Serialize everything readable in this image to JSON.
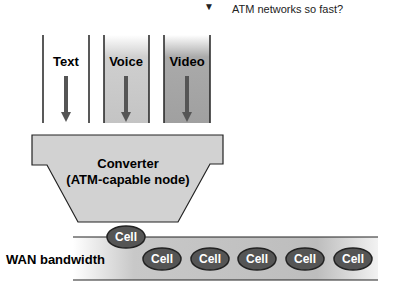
{
  "note": {
    "text": "ATM networks so fast?"
  },
  "columns": [
    {
      "label": "Text",
      "fill": "#ffffff"
    },
    {
      "label": "Voice",
      "fill": "#c8c8c8"
    },
    {
      "label": "Video",
      "fill": "#a8a8a8"
    }
  ],
  "converter": {
    "line1": "Converter",
    "line2": "(ATM-capable node)",
    "fill": "#d2d2d2"
  },
  "wan": {
    "label": "WAN bandwidth"
  },
  "cells": {
    "riding": "Cell",
    "items": [
      "Cell",
      "Cell",
      "Cell",
      "Cell",
      "Cell"
    ]
  },
  "colors": {
    "arrow": "#555555",
    "cell": "#555555",
    "line": "#222222"
  }
}
